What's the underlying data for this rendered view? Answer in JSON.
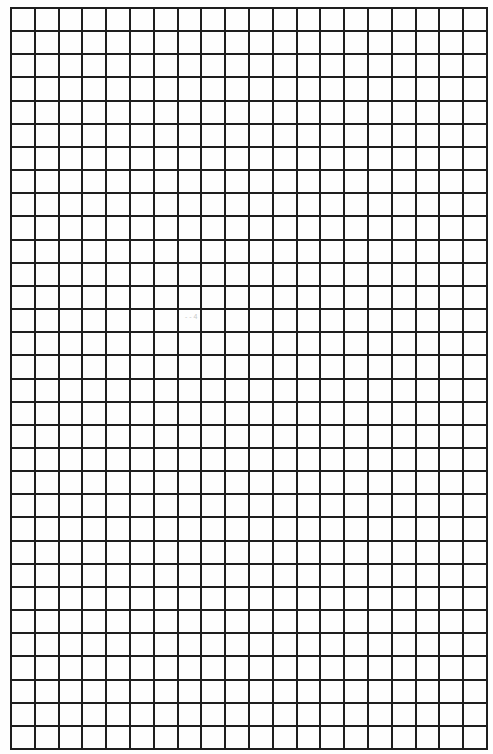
{
  "document": {
    "type": "blank grid paper",
    "grid": {
      "columns": 20,
      "rows": 32,
      "line_color": "#1e1e1e",
      "paper_color": "#fefefe"
    },
    "annotations": [
      {
        "text": "- - 4",
        "note": "faint scan artifact"
      }
    ]
  }
}
